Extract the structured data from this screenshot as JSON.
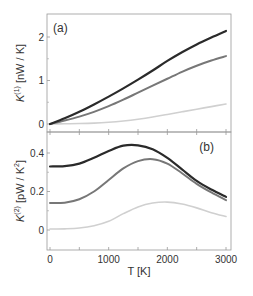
{
  "chart_data": [
    {
      "panel": "(a)",
      "type": "line",
      "title": "",
      "xlabel": "T [K]",
      "ylabel": "K(1) [nW / K]",
      "ylabel_parts": {
        "main": "K",
        "sup": "(1)",
        "unit": " [nW / K]"
      },
      "xlim": [
        0,
        3000
      ],
      "ylim": [
        -0.2,
        2.5
      ],
      "yticks": [
        0,
        1,
        2
      ],
      "yminor": [
        0.5,
        1.5
      ],
      "xticks": [
        0,
        500,
        1000,
        1500,
        2000,
        2500,
        3000
      ],
      "grid": false,
      "x": [
        0,
        250,
        500,
        750,
        1000,
        1250,
        1500,
        1750,
        2000,
        2250,
        2500,
        2750,
        3000
      ],
      "series": [
        {
          "name": "black",
          "color": "#2a2a2a",
          "width": 2.2,
          "values": [
            0,
            0.13,
            0.28,
            0.45,
            0.63,
            0.82,
            1.02,
            1.23,
            1.45,
            1.65,
            1.83,
            1.99,
            2.14
          ]
        },
        {
          "name": "gray",
          "color": "#777777",
          "width": 2.0,
          "values": [
            0,
            0.08,
            0.17,
            0.28,
            0.41,
            0.56,
            0.72,
            0.88,
            1.04,
            1.2,
            1.34,
            1.46,
            1.56
          ]
        },
        {
          "name": "light",
          "color": "#d0d0d0",
          "width": 1.6,
          "values": [
            0,
            0.005,
            0.01,
            0.02,
            0.04,
            0.07,
            0.11,
            0.16,
            0.22,
            0.28,
            0.34,
            0.4,
            0.46
          ]
        }
      ]
    },
    {
      "panel": "(b)",
      "type": "line",
      "title": "",
      "xlabel": "T [K]",
      "ylabel": "K(2) [pW / K2]",
      "ylabel_parts": {
        "main": "K",
        "sup": "(2)",
        "unit": " [pW / K",
        "unit_sup": "2",
        "unit_end": "]"
      },
      "xlim": [
        0,
        3000
      ],
      "ylim": [
        -0.1,
        0.5
      ],
      "yticks": [
        0,
        0.2,
        0.4
      ],
      "ytick_labels": [
        "0",
        "0.2",
        "0.4"
      ],
      "yminor": [
        0.1,
        0.3
      ],
      "xticks": [
        0,
        1000,
        2000,
        3000
      ],
      "xminor": [
        500,
        1500,
        2500
      ],
      "grid": false,
      "x": [
        0,
        250,
        500,
        750,
        1000,
        1250,
        1500,
        1750,
        2000,
        2250,
        2500,
        2750,
        3000
      ],
      "series": [
        {
          "name": "black",
          "color": "#2a2a2a",
          "width": 2.2,
          "values": [
            0.33,
            0.332,
            0.345,
            0.375,
            0.41,
            0.438,
            0.44,
            0.42,
            0.375,
            0.315,
            0.255,
            0.21,
            0.172
          ]
        },
        {
          "name": "gray",
          "color": "#777777",
          "width": 2.0,
          "values": [
            0.14,
            0.142,
            0.16,
            0.2,
            0.26,
            0.32,
            0.358,
            0.368,
            0.345,
            0.295,
            0.24,
            0.195,
            0.155
          ]
        },
        {
          "name": "light",
          "color": "#d0d0d0",
          "width": 1.6,
          "values": [
            0.005,
            0.006,
            0.01,
            0.022,
            0.045,
            0.085,
            0.12,
            0.14,
            0.145,
            0.135,
            0.115,
            0.09,
            0.07
          ]
        }
      ]
    }
  ]
}
